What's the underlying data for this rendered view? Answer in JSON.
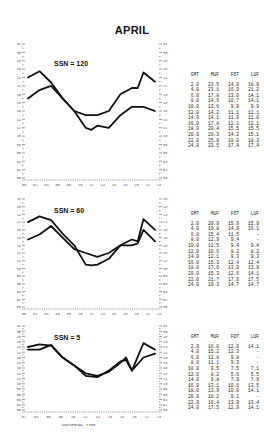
{
  "page": {
    "title": "APRIL"
  },
  "chart_data": [
    {
      "type": "line",
      "title": "SSN = 120",
      "xlabel": "UNIVERSAL TIME",
      "ylabel": "Frequency (MHz)",
      "ylim": [
        0,
        32
      ],
      "x": [
        2,
        4,
        6,
        8,
        10,
        12,
        14,
        16,
        18,
        20,
        22,
        24
      ],
      "series": [
        {
          "name": "MUF",
          "values": [
            23.5,
            23.1,
            17.8,
            14.6,
            13.6,
            14.2,
            14.1,
            17.8,
            20.4,
            20.3,
            25.0,
            23.5
          ]
        },
        {
          "name": "FOT",
          "values": [
            14.9,
            16.9,
            13.0,
            10.7,
            9.9,
            11.1,
            11.0,
            12.1,
            15.5,
            14.2,
            18.0,
            17.4
          ]
        },
        {
          "name": "LUF",
          "values": [
            18.9,
            21.2,
            14.1,
            14.1,
            9.9,
            11.1,
            11.0,
            12.1,
            15.5,
            15.1,
            18.3,
            17.4
          ]
        }
      ],
      "table": {
        "headers": [
          "GMT",
          "MUF",
          "FOT",
          "LUF"
        ],
        "rows": [
          [
            "2.0",
            "23.5",
            "14.9",
            "18.9"
          ],
          [
            "4.0",
            "23.1",
            "16.9",
            "21.2"
          ],
          [
            "6.0",
            "17.8",
            "13.0",
            "14.1"
          ],
          [
            "8.0",
            "14.6",
            "10.7",
            "14.1"
          ],
          [
            "10.0",
            "13.6",
            "9.9",
            "9.9"
          ],
          [
            "12.0",
            "14.2",
            "11.1",
            "11.1"
          ],
          [
            "14.0",
            "14.1",
            "11.0",
            "11.0"
          ],
          [
            "16.0",
            "17.8",
            "12.1",
            "12.1"
          ],
          [
            "18.0",
            "20.4",
            "15.5",
            "15.5"
          ],
          [
            "20.0",
            "20.3",
            "14.2",
            "15.1"
          ],
          [
            "22.0",
            "25.0",
            "18.0",
            "18.3"
          ],
          [
            "24.0",
            "23.5",
            "17.4",
            "17.4"
          ]
        ]
      },
      "curves": {
        "upper": [
          [
            0,
            24
          ],
          [
            2,
            25.5
          ],
          [
            4,
            22.8
          ],
          [
            6,
            19
          ],
          [
            8,
            16
          ],
          [
            10,
            15
          ],
          [
            12,
            15
          ],
          [
            14,
            16
          ],
          [
            16,
            20
          ],
          [
            18,
            21.5
          ],
          [
            19,
            21.5
          ],
          [
            20,
            25.2
          ],
          [
            22,
            23
          ]
        ],
        "lower": [
          [
            0,
            19
          ],
          [
            2,
            21
          ],
          [
            4,
            22
          ],
          [
            6,
            19
          ],
          [
            8,
            16
          ],
          [
            10,
            12
          ],
          [
            11,
            11.5
          ],
          [
            12,
            12.5
          ],
          [
            14,
            12
          ],
          [
            16,
            15
          ],
          [
            18,
            17
          ],
          [
            20,
            17
          ],
          [
            22,
            16
          ]
        ]
      },
      "x_ticks": [
        "00",
        "02",
        "04",
        "06",
        "08",
        "10",
        "12",
        "14",
        "16",
        "18",
        "20",
        "22",
        "24"
      ]
    },
    {
      "type": "line",
      "title": "SSN = 60",
      "xlabel": "UNIVERSAL TIME",
      "ylabel": "Frequency (MHz)",
      "ylim": [
        0,
        32
      ],
      "x": [
        2,
        4,
        6,
        8,
        10,
        12,
        14,
        16,
        18,
        20,
        22,
        24
      ],
      "series": [
        {
          "name": "MUF",
          "values": [
            20.9,
            19.8,
            15.4,
            12.9,
            11.5,
            10.6,
            12.1,
            15.3,
            17.0,
            15.3,
            21.7,
            19.3
          ]
        },
        {
          "name": "FOT",
          "values": [
            15.9,
            14.9,
            11.5,
            9.4,
            9.4,
            8.2,
            9.3,
            12.4,
            13.9,
            12.6,
            17.6,
            14.7
          ]
        },
        {
          "name": "LUF",
          "values": [
            15.9,
            16.1,
            "-",
            "-",
            9.4,
            8.2,
            9.3,
            12.4,
            13.9,
            14.1,
            17.5,
            14.7
          ]
        }
      ],
      "table": {
        "headers": [
          "GMT",
          "MUF",
          "FOT",
          "LUF"
        ],
        "rows": [
          [
            "2.0",
            "20.9",
            "15.9",
            "15.9"
          ],
          [
            "4.0",
            "19.8",
            "14.9",
            "16.1"
          ],
          [
            "6.0",
            "15.4",
            "11.5",
            "-"
          ],
          [
            "8.0",
            "12.9",
            "9.4",
            "-"
          ],
          [
            "10.0",
            "11.5",
            "9.4",
            "9.4"
          ],
          [
            "12.0",
            "10.6",
            "8.2",
            "8.2"
          ],
          [
            "14.0",
            "12.1",
            "9.3",
            "9.3"
          ],
          [
            "16.0",
            "15.3",
            "12.4",
            "12.4"
          ],
          [
            "18.0",
            "17.0",
            "13.9",
            "13.9"
          ],
          [
            "20.0",
            "15.3",
            "12.6",
            "14.1"
          ],
          [
            "22.0",
            "21.7",
            "17.6",
            "17.5"
          ],
          [
            "24.0",
            "19.3",
            "14.7",
            "14.7"
          ]
        ]
      },
      "curves": {
        "upper": [
          [
            0,
            22
          ],
          [
            2,
            23.5
          ],
          [
            4,
            22.5
          ],
          [
            6,
            19
          ],
          [
            8,
            16
          ],
          [
            10,
            11
          ],
          [
            11,
            10.8
          ],
          [
            12,
            11
          ],
          [
            14,
            12.5
          ],
          [
            16,
            16
          ],
          [
            18,
            17.5
          ],
          [
            19,
            17
          ],
          [
            20,
            22.8
          ],
          [
            22,
            20
          ]
        ],
        "lower": [
          [
            0,
            17.5
          ],
          [
            2,
            18.8
          ],
          [
            4,
            21
          ],
          [
            6,
            18
          ],
          [
            8,
            15
          ],
          [
            10,
            14
          ],
          [
            12,
            13
          ],
          [
            14,
            14
          ],
          [
            16,
            16
          ],
          [
            18,
            16
          ],
          [
            19,
            16.5
          ],
          [
            20,
            20
          ],
          [
            22,
            17
          ]
        ]
      },
      "x_ticks": [
        "00",
        "02",
        "04",
        "06",
        "08",
        "10",
        "12",
        "14",
        "16",
        "18",
        "20",
        "22",
        "24"
      ]
    },
    {
      "type": "line",
      "title": "SSN = 5",
      "xlabel": "UNIVERSAL TIME",
      "ylabel": "Frequency (MHz)",
      "ylim": [
        0,
        32
      ],
      "x": [
        2,
        4,
        6,
        8,
        10,
        12,
        14,
        16,
        18,
        20,
        22,
        24
      ],
      "series": [
        {
          "name": "MUF",
          "values": [
            16.0,
            15.2,
            12.8,
            11.1,
            9.5,
            8.2,
            9.8,
            13.1,
            13.9,
            10.2,
            16.4,
            17.5
          ]
        },
        {
          "name": "FOT",
          "values": [
            12.0,
            12.3,
            9.8,
            9.3,
            7.5,
            5.6,
            7.9,
            10.6,
            10.8,
            9.1,
            13.9,
            12.9
          ]
        },
        {
          "name": "LUF",
          "values": [
            14.1,
            "-",
            "-",
            "-",
            7.1,
            5.5,
            7.9,
            13.5,
            14.1,
            "-",
            13.4,
            14.1
          ]
        }
      ],
      "table": {
        "headers": [
          "GMT",
          "MUF",
          "FOT",
          "LUF"
        ],
        "rows": [
          [
            "2.0",
            "16.0",
            "12.0",
            "14.1"
          ],
          [
            "4.0",
            "15.2",
            "12.3",
            "-"
          ],
          [
            "6.0",
            "12.8",
            "9.8",
            "-"
          ],
          [
            "8.0",
            "11.1",
            "9.3",
            "-"
          ],
          [
            "10.0",
            "9.5",
            "7.5",
            "7.1"
          ],
          [
            "12.0",
            "8.2",
            "5.6",
            "5.5"
          ],
          [
            "14.0",
            "9.8",
            "7.9",
            "7.9"
          ],
          [
            "16.0",
            "13.1",
            "10.6",
            "13.5"
          ],
          [
            "18.0",
            "13.9",
            "10.8",
            "14.1"
          ],
          [
            "20.0",
            "10.2",
            "9.1",
            "-"
          ],
          [
            "22.0",
            "16.4",
            "13.9",
            "13.4"
          ],
          [
            "24.0",
            "17.5",
            "12.9",
            "14.1"
          ]
        ]
      },
      "curves": {
        "upper": [
          [
            0,
            24
          ],
          [
            2,
            25
          ],
          [
            4,
            24.5
          ],
          [
            6,
            20
          ],
          [
            8,
            17
          ],
          [
            10,
            13
          ],
          [
            12,
            12.5
          ],
          [
            14,
            15
          ],
          [
            16,
            18.5
          ],
          [
            17,
            19
          ],
          [
            18,
            15
          ],
          [
            20,
            25.5
          ],
          [
            22,
            23
          ]
        ],
        "lower": [
          [
            0,
            23
          ],
          [
            2,
            23
          ],
          [
            4,
            24.8
          ],
          [
            6,
            20
          ],
          [
            8,
            17
          ],
          [
            10,
            14
          ],
          [
            12,
            13
          ],
          [
            14,
            14.5
          ],
          [
            16,
            18
          ],
          [
            17,
            20
          ],
          [
            18,
            15
          ],
          [
            20,
            20
          ],
          [
            22,
            21.5
          ]
        ]
      },
      "x_ticks": [
        "02",
        "04",
        "06",
        "08",
        "10",
        "12",
        "14",
        "16",
        "18",
        "20",
        "22",
        "24"
      ]
    }
  ],
  "panels": [
    {
      "ssn_label": "SSN = 120"
    },
    {
      "ssn_label": "SSN = 60"
    },
    {
      "ssn_label": "SSN = 5",
      "x_axis_label": "UNIVERSAL TIME"
    }
  ],
  "style": {
    "ink": "#111111",
    "axis": "#555555",
    "table_text": "#222222"
  }
}
